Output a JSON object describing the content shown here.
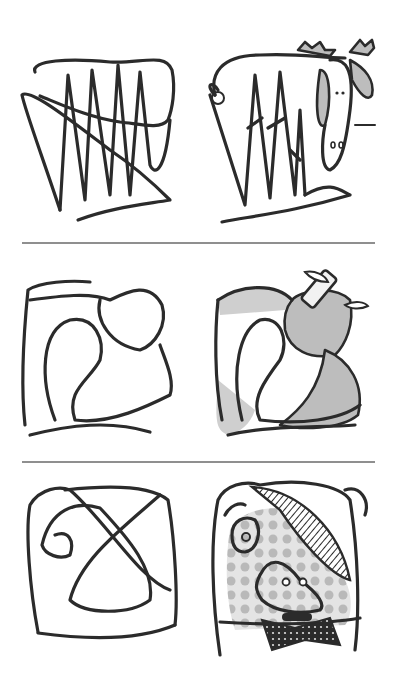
{
  "illustration": {
    "rows": [
      {
        "scribble": "zigzag-scribble",
        "drawing": "moose-drawing"
      },
      {
        "scribble": "loop-scribble",
        "drawing": "apple-drawing"
      },
      {
        "scribble": "cross-scribble",
        "drawing": "pig-with-bowtie-drawing"
      }
    ]
  },
  "colors": {
    "ink": "#2b2b2b",
    "fill_grey": "#bdbdbd",
    "divider": "#6a6a6a",
    "background": "#ffffff"
  }
}
